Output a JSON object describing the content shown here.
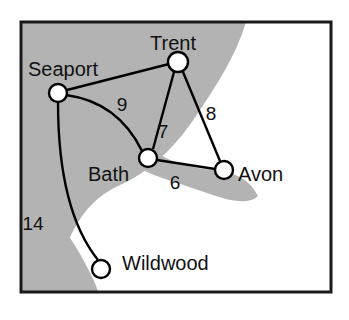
{
  "figure": {
    "kind": "weighted-graph-map",
    "width": 349,
    "height": 320,
    "title": ""
  },
  "colors": {
    "land": "#b3b3b3",
    "water": "#ffffff",
    "frame": "#1a1a1a",
    "edge": "#000000",
    "node_fill": "#ffffff",
    "node_stroke": "#000000",
    "text": "#111111",
    "page_background": "#ffffff"
  },
  "frame": {
    "x": 21,
    "y": 22,
    "width": 310,
    "height": 270,
    "stroke_width": 3
  },
  "nodes": [
    {
      "id": "seaport",
      "label": "Seaport",
      "cx": 58,
      "cy": 93,
      "r": 9,
      "label_x": 28,
      "label_y": 76,
      "anchor": "start"
    },
    {
      "id": "trent",
      "label": "Trent",
      "cx": 178,
      "cy": 62,
      "r": 10,
      "label_x": 150,
      "label_y": 50,
      "anchor": "start"
    },
    {
      "id": "bath",
      "label": "Bath",
      "cx": 148,
      "cy": 158,
      "r": 9,
      "label_x": 88,
      "label_y": 181,
      "anchor": "start"
    },
    {
      "id": "avon",
      "label": "Avon",
      "cx": 224,
      "cy": 170,
      "r": 9,
      "label_x": 238,
      "label_y": 181,
      "anchor": "start"
    },
    {
      "id": "wildwood",
      "label": "Wildwood",
      "cx": 101,
      "cy": 269,
      "r": 9,
      "label_x": 122,
      "label_y": 270,
      "anchor": "start"
    }
  ],
  "edges": [
    {
      "id": "seaport-trent",
      "from": "Seaport",
      "to": "Trent",
      "weight": "",
      "path": "M 67 90 L 169 64",
      "label_x": 0,
      "label_y": 0
    },
    {
      "id": "seaport-bath",
      "from": "Seaport",
      "to": "Bath",
      "weight": "9",
      "path": "M 66 95 Q 118 102 142 151",
      "label_x": 122,
      "label_y": 111
    },
    {
      "id": "trent-bath",
      "from": "Trent",
      "to": "Bath",
      "weight": "7",
      "path": "M 174 72 L 153 149",
      "label_x": 163,
      "label_y": 138
    },
    {
      "id": "trent-avon",
      "from": "Trent",
      "to": "Avon",
      "weight": "8",
      "path": "M 183 72 L 220 161",
      "label_x": 211,
      "label_y": 120
    },
    {
      "id": "bath-avon",
      "from": "Bath",
      "to": "Avon",
      "weight": "6",
      "path": "M 157 160 L 215 169",
      "label_x": 175,
      "label_y": 189
    },
    {
      "id": "seaport-wildwood",
      "from": "Seaport",
      "to": "Wildwood",
      "weight": "14",
      "path": "M 58 102 Q 58 210 98 260",
      "label_x": 33,
      "label_y": 230
    }
  ],
  "regions": [
    {
      "id": "landmass",
      "name": "land",
      "fill": "#b3b3b3"
    },
    {
      "id": "bay",
      "name": "water-bay",
      "fill": "#ffffff"
    }
  ],
  "legend": {
    "note": ""
  }
}
